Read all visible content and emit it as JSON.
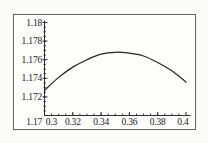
{
  "figure": {
    "background_color": "#fbfbfa",
    "frame_border_color": "#6a6a6a",
    "axis_color": "#2e2e2e",
    "curve_color": "#262626",
    "label_color": "#1c1c1c"
  },
  "chart_data": {
    "type": "line",
    "title": "",
    "xlabel": "",
    "ylabel": "",
    "xlim": [
      0.3,
      0.4
    ],
    "ylim": [
      1.17,
      1.18
    ],
    "grid": false,
    "legend": null,
    "x": [
      0.3,
      0.31,
      0.32,
      0.33,
      0.34,
      0.35,
      0.36,
      0.37,
      0.38,
      0.39,
      0.4
    ],
    "y": [
      1.1727,
      1.1741,
      1.1752,
      1.176,
      1.1766,
      1.1768,
      1.1767,
      1.1764,
      1.1757,
      1.1748,
      1.1736
    ],
    "x_tick_values": [
      0.3,
      0.32,
      0.34,
      0.36,
      0.38,
      0.4
    ],
    "x_tick_labels": [
      "0.3",
      "0.32",
      "0.34",
      "0.36",
      "0.38",
      "0.4"
    ],
    "y_tick_values": [
      1.17,
      1.172,
      1.174,
      1.176,
      1.178,
      1.18
    ],
    "y_tick_labels": [
      "1.17",
      "1.172",
      "1.174",
      "1.176",
      "1.178",
      "1.18"
    ]
  }
}
